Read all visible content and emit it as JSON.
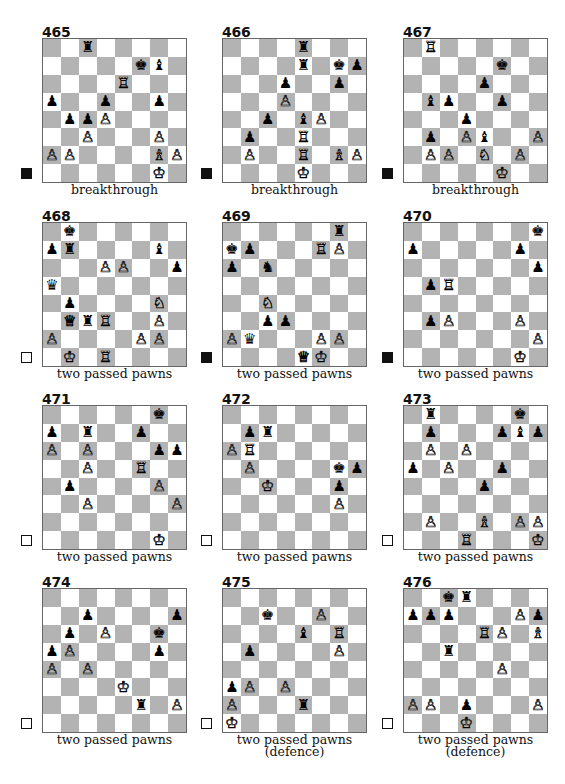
{
  "page": {
    "colors": {
      "dark_square": "#b3b3b3",
      "light_square": "#ffffff",
      "text": "#111111"
    }
  },
  "diagrams": [
    {
      "number": "465",
      "caption": "breakthrough",
      "to_move": "black",
      "pieces": {
        "c8": "bR",
        "f7": "bK",
        "g7": "bB",
        "e6": "wR",
        "a5": "bP",
        "d5": "bP",
        "g5": "bP",
        "b4": "bP",
        "c4": "bP",
        "d4": "wP",
        "c3": "wP",
        "g3": "wP",
        "a2": "wP",
        "b2": "wP",
        "g2": "wB",
        "h2": "wP",
        "g1": "wK"
      }
    },
    {
      "number": "466",
      "caption": "breakthrough",
      "to_move": "black",
      "pieces": {
        "e8": "bR",
        "e7": "bR",
        "g7": "bK",
        "h7": "bP",
        "d6": "bP",
        "g6": "bP",
        "d5": "wP",
        "c4": "bP",
        "e4": "bB",
        "f4": "wP",
        "b3": "bP",
        "e3": "wR",
        "b2": "wP",
        "e2": "wR",
        "g2": "wB",
        "h2": "wP",
        "e1": "wK"
      }
    },
    {
      "number": "467",
      "caption": "breakthrough",
      "to_move": "black",
      "pieces": {
        "b8": "wR",
        "f7": "bK",
        "e6": "bP",
        "b5": "bB",
        "c5": "bP",
        "f5": "bP",
        "d4": "bP",
        "b3": "bP",
        "d3": "wP",
        "e3": "bB",
        "h3": "wP",
        "b2": "wP",
        "c2": "wP",
        "e2": "wN",
        "g2": "wP",
        "f1": "wK"
      }
    },
    {
      "number": "468",
      "caption": "two passed pawns",
      "to_move": "white",
      "pieces": {
        "b8": "bK",
        "a7": "bP",
        "b7": "bR",
        "g7": "bB",
        "d6": "wP",
        "e6": "wP",
        "h6": "bP",
        "a5": "bQ",
        "b4": "bP",
        "g4": "wN",
        "b3": "wQ",
        "c3": "bR",
        "d3": "wR",
        "g3": "wP",
        "a2": "wP",
        "f2": "wP",
        "g2": "wP",
        "b1": "wK",
        "d1": "wR"
      }
    },
    {
      "number": "469",
      "caption": "two passed pawns",
      "to_move": "black",
      "pieces": {
        "g8": "bR",
        "a7": "bK",
        "b7": "bP",
        "f7": "wR",
        "g7": "wP",
        "a6": "bP",
        "c6": "bN",
        "c4": "wN",
        "c3": "bP",
        "d3": "bP",
        "a2": "wP",
        "b2": "bQ",
        "f2": "wP",
        "g2": "wP",
        "e1": "wQ",
        "f1": "wK"
      }
    },
    {
      "number": "470",
      "caption": "two passed pawns",
      "to_move": "black",
      "pieces": {
        "h8": "bK",
        "a7": "bP",
        "g7": "bP",
        "h6": "bP",
        "b5": "bP",
        "c5": "wR",
        "b3": "bP",
        "c3": "wP",
        "g3": "wP",
        "h2": "wP",
        "g1": "wK"
      }
    },
    {
      "number": "471",
      "caption": "two passed pawns",
      "to_move": "white",
      "pieces": {
        "g8": "bK",
        "a7": "bP",
        "c7": "bR",
        "f7": "bP",
        "a6": "wP",
        "c6": "wP",
        "g6": "bP",
        "h6": "bP",
        "c5": "wP",
        "f5": "wR",
        "b4": "bP",
        "g4": "wP",
        "c3": "wP",
        "h3": "wP",
        "g1": "wK"
      }
    },
    {
      "number": "472",
      "caption": "two passed pawns",
      "to_move": "white",
      "pieces": {
        "b7": "bP",
        "c7": "bR",
        "a6": "wP",
        "b6": "wR",
        "b5": "wP",
        "g5": "bK",
        "h5": "bP",
        "c4": "wK",
        "g4": "bP",
        "g3": "wP"
      }
    },
    {
      "number": "473",
      "caption": "two passed pawns",
      "to_move": "white",
      "pieces": {
        "b8": "bR",
        "g8": "bK",
        "b7": "bP",
        "f7": "bP",
        "g7": "bB",
        "h7": "bP",
        "b6": "wP",
        "d6": "wP",
        "a5": "bP",
        "c5": "wP",
        "f5": "bP",
        "e4": "bP",
        "b2": "wP",
        "e2": "wB",
        "g2": "wP",
        "h2": "wP",
        "d1": "wR",
        "h1": "wK"
      }
    },
    {
      "number": "474",
      "caption": "two passed pawns",
      "to_move": "white",
      "pieces": {
        "c7": "bP",
        "h7": "bP",
        "b6": "bP",
        "d6": "wP",
        "g6": "bK",
        "a5": "bP",
        "b5": "wP",
        "g5": "bP",
        "a4": "wP",
        "c4": "wP",
        "e3": "wK",
        "f2": "bR",
        "h2": "wP"
      }
    },
    {
      "number": "475",
      "caption": "two passed pawns (defence)",
      "to_move": "white",
      "pieces": {
        "c7": "bK",
        "f7": "wP",
        "e6": "bB",
        "g6": "wR",
        "b5": "bP",
        "g5": "wP",
        "a3": "bP",
        "b3": "wP",
        "d3": "wP",
        "a2": "wP",
        "e2": "bR",
        "a1": "wK"
      }
    },
    {
      "number": "476",
      "caption": "two passed pawns (defence)",
      "to_move": "white",
      "pieces": {
        "c8": "bK",
        "d8": "bR",
        "a7": "bP",
        "b7": "bP",
        "c7": "bP",
        "g7": "wP",
        "h7": "bP",
        "e6": "wR",
        "f6": "wP",
        "h6": "wB",
        "c5": "bR",
        "f4": "wP",
        "a2": "wP",
        "b2": "wP",
        "d2": "bP",
        "h2": "wP",
        "d1": "wK"
      }
    }
  ],
  "glyphs": {
    "wK": "♔",
    "wQ": "♕",
    "wR": "♖",
    "wB": "♗",
    "wN": "♘",
    "wP": "♙",
    "bK": "♚",
    "bQ": "♛",
    "bR": "♜",
    "bB": "♝",
    "bN": "♞",
    "bP": "♟"
  },
  "piece_names": {
    "K": "king",
    "Q": "queen",
    "R": "rook",
    "B": "bishop",
    "N": "knight",
    "P": "pawn"
  }
}
